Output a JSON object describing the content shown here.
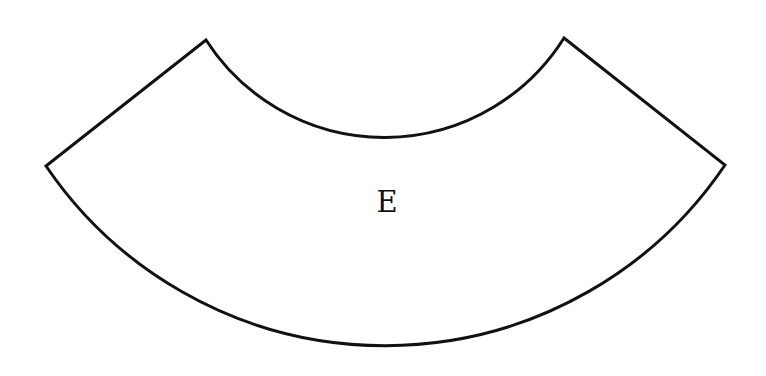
{
  "diagram": {
    "shape": "annular-sector",
    "label": "E",
    "stroke_color": "#111111",
    "fill_color": "#ffffff",
    "vertices": {
      "left": [
        46,
        166
      ],
      "top_left": [
        206,
        40
      ],
      "top_right": [
        564,
        38
      ],
      "right": [
        725,
        165
      ]
    },
    "inner_arc_bottom": [
      385,
      137
    ],
    "outer_arc_bottom": [
      385,
      347
    ]
  }
}
